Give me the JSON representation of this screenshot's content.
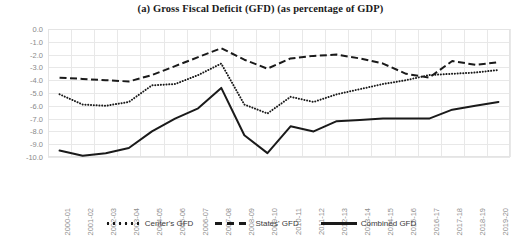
{
  "chart_data": {
    "type": "line",
    "title": "(a) Gross Fiscal Deficit (GFD) (as percentage of GDP)",
    "xlabel": "",
    "ylabel": "",
    "ylim": [
      -10.0,
      0.0
    ],
    "ytick_labels": [
      "0.0",
      "-1.0",
      "-2.0",
      "-3.0",
      "-4.0",
      "-5.0",
      "-6.0",
      "-7.0",
      "-8.0",
      "-9.0",
      "-10.0"
    ],
    "ytick_values": [
      0.0,
      -1.0,
      -2.0,
      -3.0,
      -4.0,
      -5.0,
      -6.0,
      -7.0,
      -8.0,
      -9.0,
      -10.0
    ],
    "grid": true,
    "legend_position": "bottom",
    "categories": [
      "2000-01",
      "2001-02",
      "2002-03",
      "2003-04",
      "2004-05",
      "2005-06",
      "2006-07",
      "2007-08",
      "2008-09",
      "2009-10",
      "2010-11",
      "2011-12",
      "2012-13",
      "2013-14",
      "2014-15",
      "2015-16",
      "2016-17",
      "2017-18",
      "2018-19",
      "2019-20"
    ],
    "series": [
      {
        "name": "Center's GFD",
        "style": "dotted",
        "color": "#1a1a1a",
        "values": [
          -5.1,
          -5.9,
          -6.0,
          -5.7,
          -4.4,
          -4.3,
          -3.6,
          -2.7,
          -5.9,
          -6.6,
          -5.3,
          -5.7,
          -5.1,
          -4.7,
          -4.3,
          -4.0,
          -3.6,
          -3.5,
          -3.4,
          -3.2
        ]
      },
      {
        "name": "States' GFD",
        "style": "dashed",
        "color": "#1a1a1a",
        "values": [
          -3.8,
          -3.9,
          -4.0,
          -4.1,
          -3.6,
          -2.9,
          -2.2,
          -1.5,
          -2.4,
          -3.1,
          -2.3,
          -2.1,
          -2.0,
          -2.3,
          -2.7,
          -3.5,
          -3.8,
          -2.5,
          -2.8,
          -2.6
        ]
      },
      {
        "name": "Combined GFD",
        "style": "solid",
        "color": "#1a1a1a",
        "values": [
          -9.5,
          -9.9,
          -9.7,
          -9.3,
          -8.0,
          -7.0,
          -6.2,
          -4.6,
          -8.3,
          -9.7,
          -7.6,
          -8.0,
          -7.2,
          -7.1,
          -7.0,
          -7.0,
          -7.0,
          -6.3,
          -6.0,
          -5.7
        ]
      }
    ]
  }
}
